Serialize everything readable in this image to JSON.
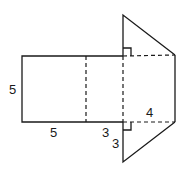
{
  "figure": {
    "labels": {
      "rect_height": "5",
      "rect_width_left": "5",
      "rect_width_right": "3",
      "triangle_leg_vertical": "3",
      "triangle_leg_horizontal": "4"
    },
    "colors": {
      "stroke": "#1a1a1a",
      "background": "#ffffff"
    }
  }
}
